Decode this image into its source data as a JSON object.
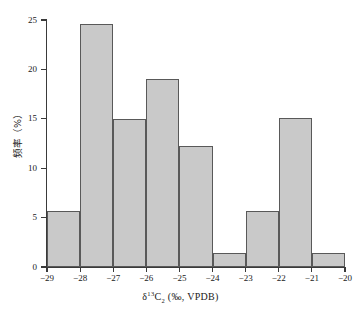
{
  "figure": {
    "background_color": "#ffffff",
    "axis_color": "#3a3a3a",
    "bar_fill_color": "#c9c9c9",
    "bar_border_color": "#595959"
  },
  "axes": {
    "y_title": "频率（%）",
    "x_title_prefix": "δ",
    "x_title_sup": "13",
    "x_title_c": "C",
    "x_title_sub": "2",
    "x_title_suffix": " (‰, VPDB)",
    "y_tick_labels": [
      "0",
      "5",
      "10",
      "15",
      "20",
      "25"
    ],
    "x_tick_labels": [
      "−29",
      "−28",
      "−27",
      "−26",
      "−25",
      "−24",
      "−23",
      "−22",
      "−21",
      "−20"
    ]
  },
  "chart_data": {
    "type": "bar",
    "title": "",
    "xlabel": "δ13C2 (‰, VPDB)",
    "ylabel": "频率（%）",
    "categories": [
      "−29 to −28",
      "−28 to −27",
      "−27 to −26",
      "−26 to −25",
      "−25 to −24",
      "−24 to −23",
      "−23 to −22",
      "−22 to −21",
      "−21 to −20"
    ],
    "bin_edges": [
      -29,
      -28,
      -27,
      -26,
      -25,
      -24,
      -23,
      -22,
      -21,
      -20
    ],
    "values": [
      5.7,
      24.6,
      15.0,
      19.0,
      12.2,
      1.4,
      5.7,
      15.1,
      1.4
    ],
    "xlim": [
      -29,
      -20
    ],
    "ylim": [
      0,
      25
    ],
    "y_ticks": [
      0,
      5,
      10,
      15,
      20,
      25
    ],
    "x_ticks": [
      -29,
      -28,
      -27,
      -26,
      -25,
      -24,
      -23,
      -22,
      -21,
      -20
    ],
    "grid": false,
    "legend": false
  }
}
